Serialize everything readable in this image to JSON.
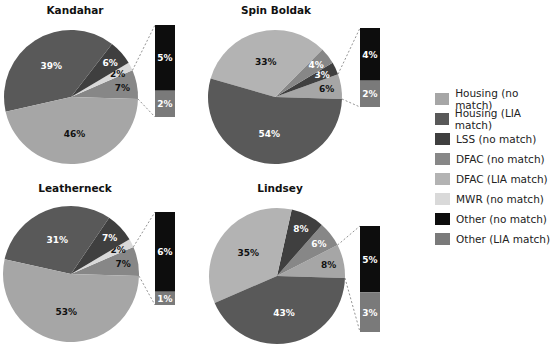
{
  "colors": {
    "Housing (no match)": "#a6a6a6",
    "Housing (LIA match)": "#595959",
    "LSS (no match)": "#3f3f3f",
    "DFAC (no match)": "#878787",
    "DFAC (LIA match)": "#b3b3b3",
    "MWR (no match)": "#d9d9d9",
    "Other (no match)": "#0d0d0d",
    "Other (LIA match)": "#7a7a7a"
  },
  "legend": [
    "Housing (no match)",
    "Housing (LIA match)",
    "LSS (no match)",
    "DFAC (no match)",
    "DFAC (LIA match)",
    "MWR (no match)",
    "Other (no match)",
    "Other (LIA match)"
  ],
  "chart_data": [
    {
      "type": "pie",
      "title": "Kandahar",
      "slices": [
        {
          "label": "Other",
          "value": 7,
          "text": "7%",
          "color": "#878787",
          "txt": "#111"
        },
        {
          "label": "MWR (no match)",
          "value": 2,
          "text": "2%",
          "color": "#d9d9d9",
          "txt": "#111"
        },
        {
          "label": "LSS (no match)",
          "value": 6,
          "text": "6%",
          "color": "#3f3f3f",
          "txt": "#fff"
        },
        {
          "label": "Housing (LIA match)",
          "value": 39,
          "text": "39%",
          "color": "#595959",
          "txt": "#fff"
        },
        {
          "label": "Housing (no match)",
          "value": 46,
          "text": "46%",
          "color": "#a6a6a6",
          "txt": "#111"
        }
      ],
      "breakout": [
        {
          "label": "Other (no match)",
          "value": 5,
          "text": "5%"
        },
        {
          "label": "Other (LIA match)",
          "value": 2,
          "text": "2%"
        }
      ]
    },
    {
      "type": "pie",
      "title": "Spin Boldak",
      "slices": [
        {
          "label": "Other",
          "value": 6,
          "text": "6%",
          "color": "#a6a6a6",
          "txt": "#111"
        },
        {
          "label": "LSS (no match)",
          "value": 3,
          "text": "3%",
          "color": "#3f3f3f",
          "txt": "#fff"
        },
        {
          "label": "DFAC (no match)",
          "value": 4,
          "text": "4%",
          "color": "#878787",
          "txt": "#fff"
        },
        {
          "label": "Housing (no match)",
          "value": 33,
          "text": "33%",
          "color": "#b3b3b3",
          "txt": "#111"
        },
        {
          "label": "Housing (LIA match)",
          "value": 54,
          "text": "54%",
          "color": "#595959",
          "txt": "#fff"
        }
      ],
      "breakout": [
        {
          "label": "Other (no match)",
          "value": 4,
          "text": "4%"
        },
        {
          "label": "Other (LIA match)",
          "value": 2,
          "text": "2%"
        }
      ]
    },
    {
      "type": "pie",
      "title": "Leatherneck",
      "slices": [
        {
          "label": "Other",
          "value": 7,
          "text": "7%",
          "color": "#878787",
          "txt": "#111"
        },
        {
          "label": "MWR (no match)",
          "value": 2,
          "text": "2%",
          "color": "#d9d9d9",
          "txt": "#111"
        },
        {
          "label": "LSS (no match)",
          "value": 7,
          "text": "7%",
          "color": "#3f3f3f",
          "txt": "#fff"
        },
        {
          "label": "Housing (LIA match)",
          "value": 31,
          "text": "31%",
          "color": "#595959",
          "txt": "#fff"
        },
        {
          "label": "Housing (no match)",
          "value": 53,
          "text": "53%",
          "color": "#a6a6a6",
          "txt": "#111"
        }
      ],
      "breakout": [
        {
          "label": "Other (no match)",
          "value": 6,
          "text": "6%"
        },
        {
          "label": "Other (LIA match)",
          "value": 1,
          "text": "1%"
        }
      ]
    },
    {
      "type": "pie",
      "title": "Lindsey",
      "slices": [
        {
          "label": "Other",
          "value": 8,
          "text": "8%",
          "color": "#a6a6a6",
          "txt": "#111"
        },
        {
          "label": "DFAC (no match)",
          "value": 6,
          "text": "6%",
          "color": "#878787",
          "txt": "#fff"
        },
        {
          "label": "LSS (no match)",
          "value": 8,
          "text": "8%",
          "color": "#3f3f3f",
          "txt": "#fff"
        },
        {
          "label": "Housing (no match)",
          "value": 35,
          "text": "35%",
          "color": "#b3b3b3",
          "txt": "#111"
        },
        {
          "label": "Housing (LIA match)",
          "value": 43,
          "text": "43%",
          "color": "#595959",
          "txt": "#fff"
        }
      ],
      "breakout": [
        {
          "label": "Other (no match)",
          "value": 5,
          "text": "5%"
        },
        {
          "label": "Other (LIA match)",
          "value": 3,
          "text": "3%"
        }
      ]
    }
  ]
}
